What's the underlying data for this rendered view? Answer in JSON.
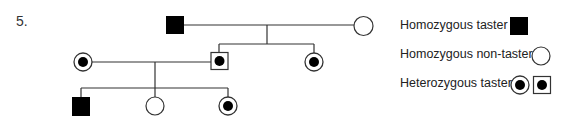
{
  "question": {
    "number": "5."
  },
  "colors": {
    "line": "#333333",
    "fill": "#000000",
    "background": "#ffffff"
  },
  "pedigree": {
    "generations": [
      {
        "generation": 1,
        "individuals": [
          {
            "id": "I-1",
            "sex": "male",
            "phenotype": "homozygous-taster",
            "symbol": "filled-square"
          },
          {
            "id": "I-2",
            "sex": "female",
            "phenotype": "homozygous-non-taster",
            "symbol": "open-circle"
          }
        ]
      },
      {
        "generation": 2,
        "individuals": [
          {
            "id": "II-1",
            "sex": "female",
            "phenotype": "heterozygous-taster",
            "symbol": "dotted-circle",
            "note": "married-in spouse"
          },
          {
            "id": "II-2",
            "sex": "male",
            "phenotype": "heterozygous-taster",
            "symbol": "dotted-square",
            "parents": [
              "I-1",
              "I-2"
            ]
          },
          {
            "id": "II-3",
            "sex": "female",
            "phenotype": "heterozygous-taster",
            "symbol": "dotted-circle",
            "parents": [
              "I-1",
              "I-2"
            ]
          }
        ]
      },
      {
        "generation": 3,
        "individuals": [
          {
            "id": "III-1",
            "sex": "male",
            "phenotype": "homozygous-taster",
            "symbol": "filled-square",
            "parents": [
              "II-1",
              "II-2"
            ]
          },
          {
            "id": "III-2",
            "sex": "female",
            "phenotype": "homozygous-non-taster",
            "symbol": "open-circle",
            "parents": [
              "II-1",
              "II-2"
            ]
          },
          {
            "id": "III-3",
            "sex": "female",
            "phenotype": "heterozygous-taster",
            "symbol": "dotted-circle",
            "parents": [
              "II-1",
              "II-2"
            ]
          }
        ]
      }
    ]
  },
  "legend": {
    "items": [
      {
        "label": "Homozygous taster",
        "symbols": [
          "filled-square"
        ]
      },
      {
        "label": "Homozygous non-taster",
        "symbols": [
          "open-circle"
        ]
      },
      {
        "label": "Heterozygous taster",
        "symbols": [
          "dotted-circle",
          "dotted-square"
        ]
      }
    ]
  }
}
